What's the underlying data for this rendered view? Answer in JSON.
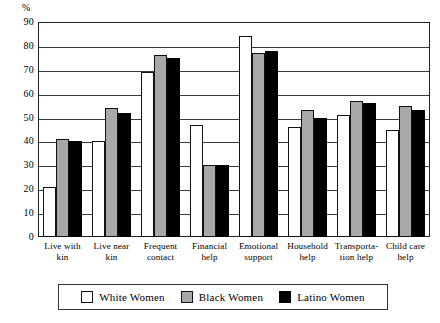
{
  "chart_data": {
    "type": "bar",
    "title": "",
    "xlabel": "",
    "ylabel": "%",
    "ylim": [
      0,
      90
    ],
    "yticks": [
      0,
      10,
      20,
      30,
      40,
      50,
      60,
      70,
      80,
      90
    ],
    "grid": true,
    "legend_position": "bottom",
    "categories": [
      "Live with kin",
      "Live near kin",
      "Frequent contact",
      "Financial help",
      "Emotional support",
      "Household help",
      "Transportation help",
      "Child care help"
    ],
    "category_lines": [
      [
        "Live with",
        "kin"
      ],
      [
        "Live near",
        "kin"
      ],
      [
        "Frequent",
        "contact"
      ],
      [
        "Financial",
        "help"
      ],
      [
        "Emotional",
        "support"
      ],
      [
        "Household",
        "help"
      ],
      [
        "Transporta-",
        "tion help"
      ],
      [
        "Child care",
        "help"
      ]
    ],
    "series": [
      {
        "name": "White Women",
        "color": "#ffffff",
        "swatch": "white",
        "values": [
          21,
          40,
          69,
          47,
          84,
          46,
          51,
          45
        ]
      },
      {
        "name": "Black Women",
        "color": "#a8a8a8",
        "swatch": "gray",
        "values": [
          41,
          54,
          76,
          30,
          77,
          53,
          57,
          55
        ]
      },
      {
        "name": "Latino Women",
        "color": "#000000",
        "swatch": "black",
        "values": [
          40,
          52,
          75,
          30,
          78,
          50,
          56,
          53
        ]
      }
    ]
  }
}
